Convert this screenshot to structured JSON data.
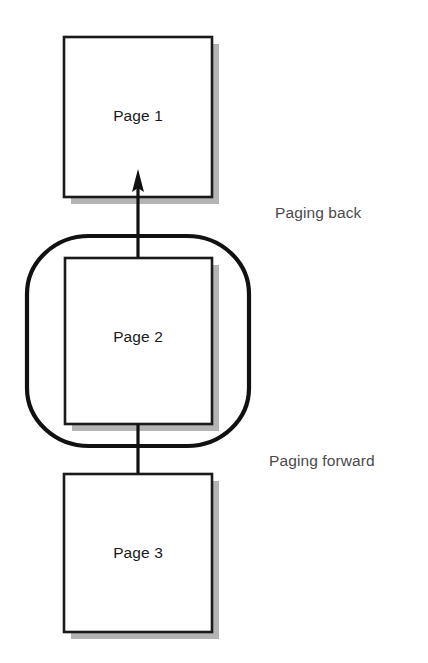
{
  "diagram": {
    "background_color": "#ffffff",
    "box_border_color": "#1a1a1a",
    "box_fill_color": "#ffffff",
    "shadow_color": "#b0b0b0",
    "arrow_color": "#111111",
    "blob_stroke_color": "#111111",
    "label_color": "#4a4a4a",
    "page_label_color": "#1a1a1a"
  },
  "boxes": [
    {
      "id": "page-1",
      "label": "Page 1",
      "x": 64,
      "y": 37,
      "width": 148,
      "height": 160,
      "label_x": 138,
      "label_y": 117
    },
    {
      "id": "page-2",
      "label": "Page 2",
      "x": 65,
      "y": 258,
      "width": 147,
      "height": 166,
      "label_x": 138,
      "label_y": 338
    },
    {
      "id": "page-3",
      "label": "Page 3",
      "x": 64,
      "y": 474,
      "width": 148,
      "height": 158,
      "label_x": 138,
      "label_y": 554
    }
  ],
  "blob": {
    "id": "current-page-highlight",
    "x": 27,
    "y": 236,
    "width": 222,
    "height": 210,
    "corner_radius": 60,
    "stroke_width": 4
  },
  "arrows": [
    {
      "id": "paging-back-arrow",
      "direction": "up",
      "x": 138,
      "from_y": 258,
      "to_y": 170,
      "stroke_width": 3,
      "head_width": 11,
      "head_length": 22
    },
    {
      "id": "paging-forward-arrow",
      "direction": "down",
      "x": 138,
      "from_y": 424,
      "to_y": 520,
      "stroke_width": 3,
      "head_width": 11,
      "head_length": 22
    }
  ],
  "annotations": [
    {
      "id": "paging-back-label",
      "text": "Paging back",
      "x": 275,
      "y": 214
    },
    {
      "id": "paging-forward-label",
      "text": "Paging forward",
      "x": 269,
      "y": 462
    }
  ],
  "shadow_offset": 7
}
